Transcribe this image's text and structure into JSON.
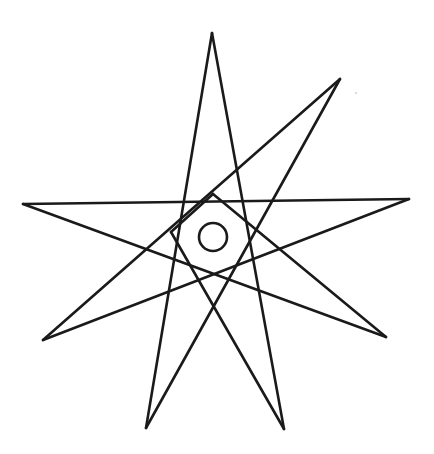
{
  "figure": {
    "width": 434,
    "height": 454,
    "stroke_color": "#1a1a1a",
    "stroke_width": 2.6,
    "background": "#ffffff",
    "segments": [
      [
        212,
        33,
        146,
        428
      ],
      [
        212,
        33,
        284,
        429
      ],
      [
        23,
        204,
        409,
        199
      ],
      [
        23,
        204,
        386,
        337
      ],
      [
        409,
        199,
        43,
        340
      ],
      [
        340,
        79,
        43,
        340
      ],
      [
        340,
        79,
        146,
        428
      ],
      [
        386,
        337,
        213,
        194
      ],
      [
        213,
        194,
        171,
        232
      ],
      [
        171,
        232,
        284,
        429
      ]
    ],
    "circle": {
      "cx": 213,
      "cy": 237,
      "r": 14
    },
    "dot": {
      "cx": 356,
      "cy": 93,
      "r": 0.7
    }
  }
}
